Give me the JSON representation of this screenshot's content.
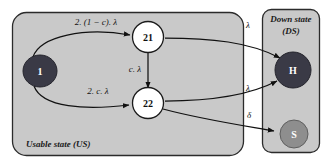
{
  "diagram": {
    "groups": [
      {
        "id": "us",
        "label": "Usable state (US)"
      },
      {
        "id": "ds",
        "label": "Down state (DS)"
      }
    ],
    "nodes": [
      {
        "id": "n1",
        "label": "1",
        "style": "dark",
        "group": "us"
      },
      {
        "id": "n21",
        "label": "21",
        "style": "white",
        "group": "us"
      },
      {
        "id": "n22",
        "label": "22",
        "style": "white",
        "group": "us"
      },
      {
        "id": "nh",
        "label": "H",
        "style": "dark",
        "group": "ds"
      },
      {
        "id": "ns",
        "label": "S",
        "style": "mid",
        "group": "ds"
      }
    ],
    "edges": [
      {
        "id": "e1",
        "from": "n1",
        "to": "n21",
        "label": "2. (1 − c). λ"
      },
      {
        "id": "e2",
        "from": "n1",
        "to": "n22",
        "label": "2. c. λ"
      },
      {
        "id": "e3",
        "from": "n21",
        "to": "n22",
        "label": "c. λ"
      },
      {
        "id": "e4",
        "from": "n21",
        "to": "nh",
        "label": "λ"
      },
      {
        "id": "e5",
        "from": "n22",
        "to": "nh",
        "label": "λ"
      },
      {
        "id": "e6",
        "from": "n22",
        "to": "ns",
        "label": "δ"
      }
    ],
    "colors": {
      "group_fill": "#c9c9c9",
      "node_dark": "#3a3a46",
      "node_mid": "#8e8e8e",
      "node_white": "#ffffff",
      "stroke": "#111111"
    }
  }
}
